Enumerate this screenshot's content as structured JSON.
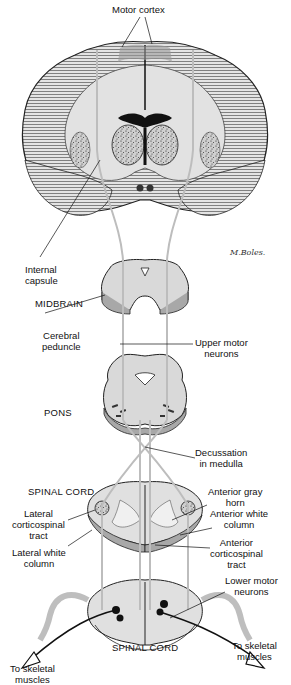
{
  "labels": {
    "motor_cortex": "Motor cortex",
    "internal_capsule_1": "Internal",
    "internal_capsule_2": "capsule",
    "midbrain": "MIDBRAIN",
    "cerebral_peduncle_1": "Cerebral",
    "cerebral_peduncle_2": "peduncle",
    "upper_motor_1": "Upper motor",
    "upper_motor_2": "neurons",
    "pons": "PONS",
    "decussation_1": "Decussation",
    "decussation_2": "in medulla",
    "spinal_cord_upper": "SPINAL CORD",
    "lateral_cst_1": "Lateral",
    "lateral_cst_2": "corticospinal",
    "lateral_cst_3": "tract",
    "lateral_white_1": "Lateral white",
    "lateral_white_2": "column",
    "anterior_gray_1": "Anterior gray",
    "anterior_gray_2": "horn",
    "anterior_white_1": "Anterior white",
    "anterior_white_2": "column",
    "anterior_cst_1": "Anterior",
    "anterior_cst_2": "corticospinal",
    "anterior_cst_3": "tract",
    "lower_motor_1": "Lower motor",
    "lower_motor_2": "neurons",
    "spinal_cord_lower": "SPINAL CORD",
    "skeletal_left_1": "To skeletal",
    "skeletal_left_2": "muscles",
    "skeletal_right_1": "To skeletal",
    "skeletal_right_2": "muscles"
  },
  "signature": "M.Boles.",
  "colors": {
    "tissue": "#d9d9d9",
    "tissue_dark": "#a8a8a8",
    "hatch": "#555555",
    "tract": "#bdbdbd",
    "line": "#111111"
  }
}
